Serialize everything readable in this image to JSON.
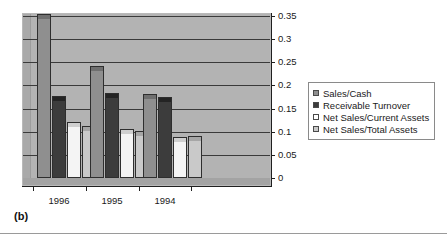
{
  "figure": {
    "caption": "(b)"
  },
  "chart_data": {
    "type": "bar",
    "title": "",
    "subtitle": "",
    "xlabel": "",
    "ylabel": "",
    "categories": [
      "1996",
      "1995",
      "1994"
    ],
    "series": [
      {
        "name": "Sales/Cash",
        "color": "#8f8f8f",
        "values": [
          0.345,
          0.233,
          0.172
        ]
      },
      {
        "name": "Receivable Turnover",
        "color": "#3c3c3c",
        "values": [
          0.168,
          0.175,
          0.167
        ]
      },
      {
        "name": "Net Sales/Current Assets",
        "color": "#ffffff",
        "values": [
          0.112,
          0.098,
          0.08
        ]
      },
      {
        "name": "Net Sales/Total Assets",
        "color": "#c9c9c9",
        "values": [
          0.103,
          0.092,
          0.082
        ]
      }
    ],
    "ylim": [
      0,
      0.35
    ],
    "ytick_step": 0.05,
    "yticks": [
      "0",
      "0.05",
      "0.1",
      "0.15",
      "0.2",
      "0.25",
      "0.3",
      "0.35"
    ],
    "ytick_values": [
      0,
      0.05,
      0.1,
      0.15,
      0.2,
      0.25,
      0.3,
      0.35
    ],
    "y_axis_position": "right",
    "grid": true,
    "grid_axis": "y",
    "legend": true,
    "legend_position": "right",
    "style": "3d-column",
    "plot_background": "#b3b3b3"
  }
}
